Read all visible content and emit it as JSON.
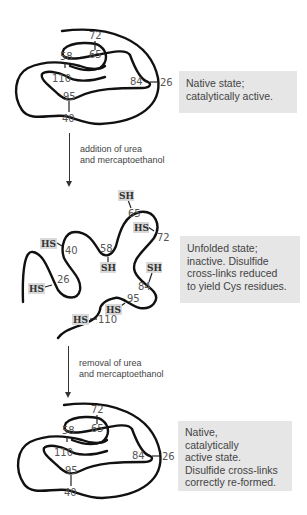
{
  "states": [
    {
      "id": "native",
      "caption": [
        "Native state;",
        "catalytically active."
      ],
      "residue_labels": [
        "72",
        "65",
        "58",
        "110",
        "84",
        "26",
        "95",
        "40"
      ]
    },
    {
      "id": "unfolded",
      "caption": [
        "Unfolded state;",
        "inactive. Disulfide",
        "cross-links reduced",
        "to yield Cys residues."
      ],
      "residue_labels": [
        "65",
        "72",
        "40",
        "58",
        "84",
        "26",
        "95",
        "110"
      ],
      "thiol_labels": [
        "SH",
        "HS",
        "HS",
        "SH",
        "SH",
        "HS",
        "HS",
        "HS"
      ]
    },
    {
      "id": "refolded",
      "caption": [
        "Native,",
        "catalytically",
        "active state.",
        "Disulfide cross-links",
        "correctly re-formed."
      ],
      "residue_labels": [
        "72",
        "65",
        "58",
        "110",
        "84",
        "26",
        "95",
        "40"
      ]
    }
  ],
  "steps": [
    {
      "label": [
        "addition of urea",
        "and mercaptoethanol"
      ]
    },
    {
      "label": [
        "removal of urea",
        "and mercaptoethanol"
      ]
    }
  ],
  "colors": {
    "caption_bg": "#e6e6e6",
    "thiol_bg": "#d9d9d9",
    "strand": "#111111"
  }
}
